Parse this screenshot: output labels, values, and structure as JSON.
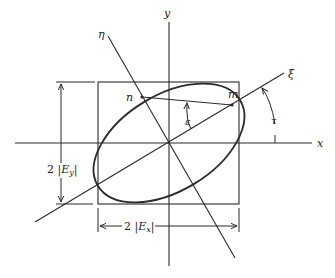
{
  "diagram": {
    "colors": {
      "line": "#2a2a2a",
      "background": "#ffffff",
      "text": "#222222"
    },
    "axes": {
      "x_label": "x",
      "y_label": "y",
      "xi_label": "ξ",
      "eta_label": "η"
    },
    "points": {
      "n_label": "n",
      "m_label": "m"
    },
    "angles": {
      "epsilon_label": "ε",
      "tau_label": "τ"
    },
    "dimensions": {
      "ey_prefix": "2 |",
      "ey_var": "E",
      "ey_sub": "y",
      "ey_suffix": "|",
      "ex_prefix": "2 |",
      "ex_var": "E",
      "ex_sub": "x",
      "ex_suffix": "|"
    }
  }
}
